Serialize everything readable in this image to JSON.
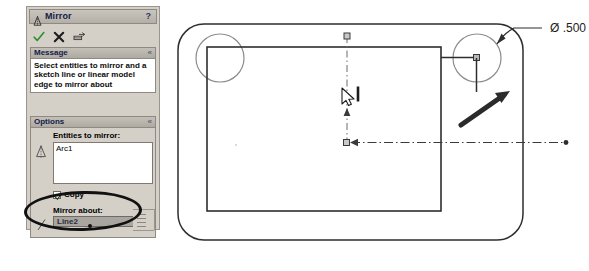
{
  "panel": {
    "title": "Mirror",
    "help_label": "?",
    "title_icon": "mirror-icon",
    "toolbar": {
      "ok_label": "OK",
      "cancel_label": "Cancel",
      "preview_label": "Preview"
    },
    "message_section": {
      "header": "Message",
      "collapse_label": "«",
      "text": "Select entities to mirror and a sketch line or linear model edge to mirror about"
    },
    "options_section": {
      "header": "Options",
      "collapse_label": "«",
      "entities_label": "Entities to mirror:",
      "entities_items": [
        "Arc1"
      ],
      "copy_label": "Copy",
      "copy_checked": true,
      "mirror_about_label": "Mirror about:",
      "mirror_about_value": "Line2"
    }
  },
  "canvas": {
    "dimension_label": "Ø .500",
    "cursor_tooltip": "line-cursor-icon"
  },
  "colors": {
    "panel_bg": "#d4d0c8",
    "title_text": "#13204a",
    "ok_green": "#2f8b2f",
    "cancel_dark": "#1d1d1d",
    "selection_bg": "#a9a5a0",
    "sketch_line": "#3a3a3a",
    "annotation": "#111111"
  }
}
